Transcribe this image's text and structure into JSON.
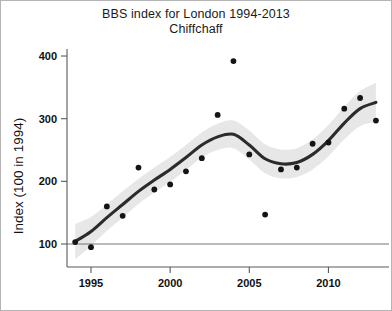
{
  "figure": {
    "title_line1": "BBS index for London 1994-2013",
    "title_line2": "Chiffchaff",
    "background": "#ffffff",
    "border_color": "#b4b4b4"
  },
  "chart_data": {
    "type": "scatter",
    "title": "BBS index for London 1994-2013 Chiffchaff",
    "subtitle": "Chiffchaff",
    "xlabel": "",
    "ylabel": "Index (100 in 1994)",
    "xlim": [
      1993.4,
      2013.6
    ],
    "ylim": [
      60,
      415
    ],
    "grid": false,
    "legend": null,
    "x_ticks": [
      1995,
      2000,
      2005,
      2010
    ],
    "x_tick_labels": [
      "1995",
      "2000",
      "2005",
      "2010"
    ],
    "y_ticks": [
      100,
      200,
      300,
      400
    ],
    "y_tick_labels": [
      "100",
      "200",
      "300",
      "400"
    ],
    "reference_line": {
      "y": 100,
      "color": "#767676"
    },
    "x": [
      1994,
      1995,
      1996,
      1997,
      1998,
      1999,
      2000,
      2001,
      2002,
      2003,
      2004,
      2005,
      2006,
      2007,
      2008,
      2009,
      2010,
      2011,
      2012,
      2013
    ],
    "series": [
      {
        "name": "Annual index",
        "type": "scatter",
        "color": "#141414",
        "values": [
          103,
          95,
          160,
          145,
          222,
          187,
          195,
          216,
          237,
          306,
          392,
          243,
          147,
          219,
          222,
          260,
          262,
          316,
          333,
          297
        ]
      },
      {
        "name": "Smoothed trend",
        "type": "line",
        "color": "#2b2b2b",
        "values": [
          104,
          120,
          142,
          163,
          184,
          202,
          219,
          238,
          258,
          271,
          275,
          258,
          236,
          228,
          230,
          243,
          265,
          293,
          316,
          326
        ]
      },
      {
        "name": "95% confidence band (upper)",
        "type": "band_upper",
        "color": "#d8d8d8",
        "values": [
          132,
          143,
          163,
          184,
          204,
          222,
          239,
          258,
          278,
          292,
          297,
          281,
          259,
          251,
          253,
          267,
          290,
          319,
          344,
          357
        ]
      },
      {
        "name": "95% confidence band (lower)",
        "type": "band_lower",
        "color": "#d8d8d8",
        "values": [
          76,
          97,
          121,
          142,
          164,
          182,
          199,
          218,
          238,
          250,
          253,
          235,
          213,
          205,
          207,
          219,
          240,
          267,
          288,
          295
        ]
      }
    ]
  }
}
